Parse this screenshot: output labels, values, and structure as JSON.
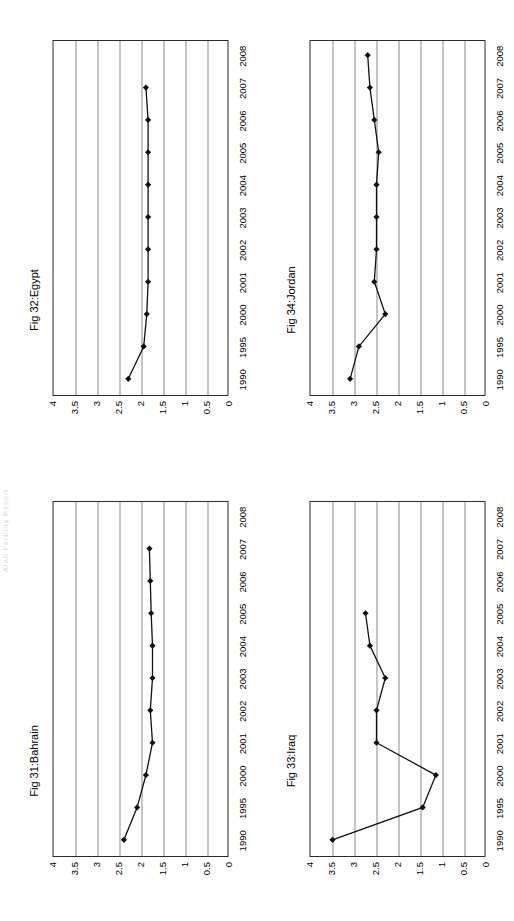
{
  "page": {
    "width": 514,
    "height": 921,
    "background": "#ffffff",
    "orientation": "landscape-rotated-90ccw",
    "edge_header_fragment": "Arab Fertility Report"
  },
  "axis": {
    "y_ticks": [
      "4",
      "3.5",
      "3",
      "2.5",
      "2",
      "1.5",
      "1",
      "0.5",
      "0"
    ],
    "y_min": 0,
    "y_max": 4,
    "x_ticks": [
      "1990",
      "1995",
      "2000",
      "2001",
      "2002",
      "2003",
      "2004",
      "2005",
      "2006",
      "2007",
      "2008"
    ],
    "grid": "horizontal-only",
    "xlabel": "",
    "ylabel": ""
  },
  "charts": [
    {
      "id": "bahrain",
      "position": "bottom-left",
      "title_en": "Fig 31:Bahrain",
      "title_ar": "شكل 31: البحرين",
      "last_year_index": 9
    },
    {
      "id": "egypt",
      "position": "top-left",
      "title_en": "Fig 32:Egypt",
      "title_ar": "شكل 32: مصر",
      "last_year_index": 9
    },
    {
      "id": "iraq",
      "position": "bottom-right",
      "title_en": "Fig 33:Iraq",
      "title_ar": "شكل 33: العراق",
      "last_year_index": 7
    },
    {
      "id": "jordan",
      "position": "top-right",
      "title_en": "Fig 34:Jordan",
      "title_ar": "شكل 34: الأردن",
      "last_year_index": 10
    }
  ],
  "chart_data": [
    {
      "type": "line",
      "id": "bahrain",
      "title": "Fig 31:Bahrain",
      "title_ar": "شكل 31: البحرين",
      "x": [
        "1990",
        "1995",
        "2000",
        "2001",
        "2002",
        "2003",
        "2004",
        "2005",
        "2006",
        "2007"
      ],
      "values": [
        2.4,
        2.1,
        1.9,
        1.75,
        1.8,
        1.75,
        1.75,
        1.78,
        1.8,
        1.82
      ],
      "xlabel": "",
      "ylabel": "",
      "ylim": [
        0,
        4
      ],
      "grid": true,
      "legend": "none",
      "marker": "diamond",
      "color": "#111111"
    },
    {
      "type": "line",
      "id": "egypt",
      "title": "Fig 32:Egypt",
      "title_ar": "شكل 32: مصر",
      "x": [
        "1990",
        "1995",
        "2000",
        "2001",
        "2002",
        "2003",
        "2004",
        "2005",
        "2006",
        "2007"
      ],
      "values": [
        2.3,
        1.95,
        1.88,
        1.85,
        1.85,
        1.85,
        1.85,
        1.85,
        1.85,
        1.9
      ],
      "xlabel": "",
      "ylabel": "",
      "ylim": [
        0,
        4
      ],
      "grid": true,
      "legend": "none",
      "marker": "diamond",
      "color": "#111111"
    },
    {
      "type": "line",
      "id": "iraq",
      "title": "Fig 33:Iraq",
      "title_ar": "شكل 33: العراق",
      "x": [
        "1990",
        "1995",
        "2000",
        "2001",
        "2002",
        "2003",
        "2004",
        "2005"
      ],
      "values": [
        3.5,
        1.45,
        1.15,
        2.5,
        2.5,
        2.3,
        2.65,
        2.75
      ],
      "xlabel": "",
      "ylabel": "",
      "ylim": [
        0,
        4
      ],
      "grid": true,
      "legend": "none",
      "marker": "diamond",
      "color": "#111111"
    },
    {
      "type": "line",
      "id": "jordan",
      "title": "Fig 34:Jordan",
      "title_ar": "شكل 34: الأردن",
      "x": [
        "1990",
        "1995",
        "2000",
        "2001",
        "2002",
        "2003",
        "2004",
        "2005",
        "2006",
        "2007",
        "2008"
      ],
      "values": [
        3.1,
        2.9,
        2.3,
        2.55,
        2.5,
        2.5,
        2.5,
        2.45,
        2.55,
        2.65,
        2.7
      ],
      "xlabel": "",
      "ylabel": "",
      "ylim": [
        0,
        4
      ],
      "grid": true,
      "legend": "none",
      "marker": "diamond",
      "color": "#111111"
    }
  ]
}
